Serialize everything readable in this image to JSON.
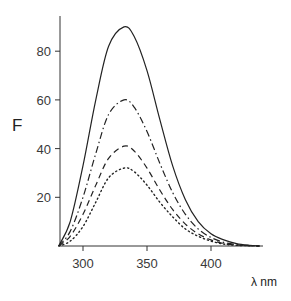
{
  "chart_data": {
    "type": "line",
    "title": "",
    "xlabel": "λ nm",
    "ylabel": "F",
    "xlim": [
      281,
      438
    ],
    "ylim": [
      0,
      95
    ],
    "xticks": [
      300,
      350,
      400
    ],
    "yticks": [
      20,
      40,
      60,
      80
    ],
    "grid": false,
    "legend": null,
    "peak_wavelength": 332,
    "x": [
      281,
      290,
      300,
      310,
      320,
      332,
      340,
      350,
      360,
      370,
      380,
      390,
      400,
      410,
      420,
      430,
      438
    ],
    "series": [
      {
        "name": "solid",
        "style": "solid",
        "peak": 90,
        "values": [
          0,
          10,
          33,
          60,
          82,
          90,
          86,
          72,
          52,
          33,
          19,
          10,
          5,
          2.5,
          1,
          0.3,
          0
        ]
      },
      {
        "name": "dash-dot",
        "style": "dashdot",
        "peak": 60,
        "values": [
          0,
          6,
          20,
          38,
          54,
          60,
          57,
          47,
          34,
          22,
          13,
          7,
          3.5,
          1.5,
          0.6,
          0.2,
          0
        ]
      },
      {
        "name": "dashed",
        "style": "dashed",
        "peak": 41,
        "values": [
          0,
          4,
          13,
          25,
          36,
          41,
          39,
          32,
          23,
          15,
          9,
          5,
          2.5,
          1,
          0.4,
          0.1,
          0
        ]
      },
      {
        "name": "dotted",
        "style": "dotted",
        "peak": 32,
        "values": [
          0,
          2,
          8,
          18,
          28,
          32,
          30.5,
          25,
          18,
          12,
          7,
          4,
          2,
          0.8,
          0.3,
          0.1,
          0
        ]
      }
    ]
  },
  "labels": {
    "y_axis": "F",
    "x_axis": "λ nm",
    "x_ticks": [
      "300",
      "350",
      "400"
    ],
    "y_ticks": [
      "20",
      "40",
      "60",
      "80"
    ]
  }
}
